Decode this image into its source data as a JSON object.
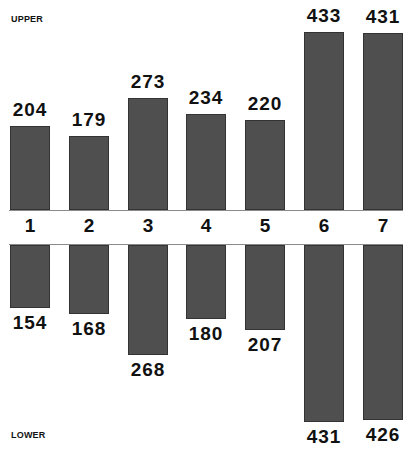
{
  "chart_data": {
    "type": "bar",
    "title": "",
    "xlabel": "",
    "ylabel": "",
    "categories": [
      "1",
      "2",
      "3",
      "4",
      "5",
      "6",
      "7"
    ],
    "series": [
      {
        "name": "UPPER",
        "values": [
          204,
          179,
          273,
          234,
          220,
          433,
          431
        ]
      },
      {
        "name": "LOWER",
        "values": [
          154,
          168,
          268,
          180,
          207,
          431,
          426
        ]
      }
    ],
    "layout": "mirrored bars: UPPER above shared category axis, LOWER below",
    "grid": false,
    "data_labels": true
  },
  "labels": {
    "upper": "UPPER",
    "lower": "LOWER"
  },
  "colors": {
    "bar_fill": "#bdbdbd",
    "bar_border": "#333333",
    "axis": "#8a8a8a",
    "text": "#111111"
  }
}
